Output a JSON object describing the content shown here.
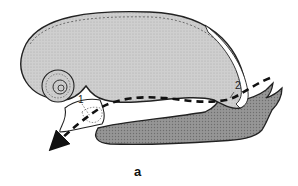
{
  "figure": {
    "caption": "a",
    "labels": [
      {
        "id": "1",
        "text": "1"
      },
      {
        "id": "2",
        "text": "2"
      }
    ],
    "colors": {
      "shell_fill": "#c9c9c9",
      "foot_fill": "#8f8f8f",
      "outline": "#222222",
      "arrow": "#111111",
      "background": "#ffffff"
    }
  }
}
